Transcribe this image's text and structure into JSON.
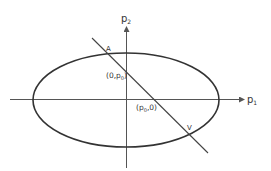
{
  "diagram": {
    "type": "ellipse-with-secant-line",
    "colors": {
      "background": "#ffffff",
      "stroke": "#333333",
      "axis": "#555555",
      "text": "#333333"
    },
    "axes": {
      "x_label": "p",
      "x_label_sub": "1",
      "y_label": "p",
      "y_label_sub": "2"
    },
    "points": {
      "A": {
        "label": "A"
      },
      "V": {
        "label": "V"
      },
      "y_intercept": {
        "open": "(0,p",
        "sub": "0",
        "close": ")"
      },
      "x_intercept": {
        "open": "(p",
        "sub": "0",
        "close": ",0)"
      }
    }
  }
}
